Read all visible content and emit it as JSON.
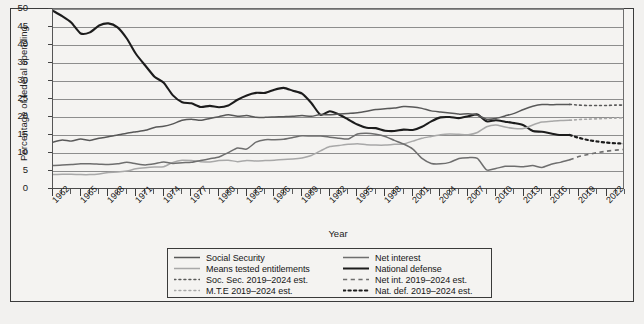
{
  "chart_data": {
    "type": "line",
    "title": "",
    "xlabel": "Year",
    "ylabel": "Percentage of federal spending",
    "xlim": [
      1962,
      2024
    ],
    "ylim": [
      0,
      50
    ],
    "yticks": [
      0,
      5,
      10,
      15,
      20,
      25,
      30,
      35,
      40,
      45,
      50
    ],
    "xticks": [
      1962,
      1965,
      1968,
      1971,
      1974,
      1977,
      1980,
      1983,
      1986,
      1989,
      1992,
      1995,
      1998,
      2001,
      2004,
      2007,
      2010,
      2013,
      2016,
      2019,
      2022
    ],
    "grid": true,
    "legend_position": "bottom-center",
    "x": [
      1962,
      1963,
      1964,
      1965,
      1966,
      1967,
      1968,
      1969,
      1970,
      1971,
      1972,
      1973,
      1974,
      1975,
      1976,
      1977,
      1978,
      1979,
      1980,
      1981,
      1982,
      1983,
      1984,
      1985,
      1986,
      1987,
      1988,
      1989,
      1990,
      1991,
      1992,
      1993,
      1994,
      1995,
      1996,
      1997,
      1998,
      1999,
      2000,
      2001,
      2002,
      2003,
      2004,
      2005,
      2006,
      2007,
      2008,
      2009,
      2010,
      2011,
      2012,
      2013,
      2014,
      2015,
      2016,
      2017,
      2018
    ],
    "series": [
      {
        "name": "National defense",
        "color": "#1c1c1c",
        "width": 2.1,
        "style": "solid",
        "values": [
          49.5,
          48.0,
          46.2,
          43.2,
          43.5,
          45.4,
          46.0,
          44.9,
          41.8,
          37.5,
          34.3,
          31.2,
          29.5,
          26.0,
          24.1,
          23.8,
          22.8,
          23.1,
          22.7,
          23.2,
          24.8,
          26.0,
          26.7,
          26.7,
          27.6,
          28.1,
          27.3,
          26.5,
          23.9,
          20.6,
          21.6,
          20.7,
          19.3,
          17.9,
          17.0,
          16.9,
          16.2,
          16.1,
          16.5,
          16.4,
          17.3,
          18.8,
          19.9,
          20.0,
          19.7,
          20.2,
          20.7,
          18.8,
          19.1,
          18.7,
          18.3,
          17.7,
          16.1,
          15.9,
          15.4,
          15.0,
          15.0
        ]
      },
      {
        "name": "Social Security",
        "color": "#585858",
        "width": 1.5,
        "style": "solid",
        "values": [
          13.0,
          13.6,
          13.3,
          13.9,
          13.5,
          14.1,
          14.5,
          15.0,
          15.5,
          15.9,
          16.3,
          17.1,
          17.4,
          18.1,
          19.1,
          19.4,
          19.1,
          19.6,
          20.1,
          20.6,
          20.2,
          20.4,
          19.9,
          19.9,
          20.0,
          20.1,
          20.2,
          20.4,
          20.2,
          20.7,
          20.6,
          20.8,
          21.0,
          21.2,
          21.6,
          22.1,
          22.3,
          22.5,
          22.9,
          22.8,
          22.4,
          21.7,
          21.4,
          21.1,
          20.8,
          20.9,
          20.5,
          19.4,
          19.6,
          20.3,
          21.0,
          22.1,
          23.0,
          23.5,
          23.4,
          23.5,
          23.5
        ]
      },
      {
        "name": "Means tested entitlements",
        "color": "#a8a8a8",
        "width": 1.5,
        "style": "solid",
        "values": [
          4.0,
          4.1,
          4.1,
          4.0,
          4.0,
          4.2,
          4.6,
          4.7,
          5.0,
          5.6,
          5.9,
          6.1,
          6.2,
          7.4,
          8.0,
          7.9,
          7.6,
          7.5,
          7.9,
          8.0,
          7.6,
          7.9,
          7.8,
          7.9,
          8.0,
          8.2,
          8.3,
          8.6,
          9.3,
          10.6,
          11.8,
          12.1,
          12.4,
          12.6,
          12.3,
          12.2,
          12.2,
          12.4,
          12.5,
          13.3,
          14.1,
          14.6,
          15.1,
          15.3,
          15.2,
          15.1,
          15.7,
          17.3,
          17.8,
          17.2,
          16.8,
          16.8,
          17.8,
          18.6,
          18.8,
          19.0,
          19.1
        ]
      },
      {
        "name": "Net interest",
        "color": "#6e6e6e",
        "width": 1.5,
        "style": "solid",
        "values": [
          6.5,
          6.7,
          6.8,
          7.0,
          7.0,
          6.9,
          6.8,
          7.0,
          7.4,
          7.0,
          6.7,
          7.0,
          7.5,
          7.1,
          7.3,
          7.4,
          7.9,
          8.4,
          8.9,
          10.1,
          11.4,
          11.1,
          13.0,
          13.7,
          13.7,
          13.8,
          14.3,
          14.8,
          14.7,
          14.7,
          14.4,
          14.1,
          13.9,
          15.3,
          15.5,
          15.2,
          14.6,
          13.5,
          12.5,
          11.1,
          8.5,
          7.1,
          7.0,
          7.4,
          8.5,
          8.7,
          8.5,
          5.3,
          5.7,
          6.3,
          6.3,
          6.2,
          6.5,
          6.0,
          6.9,
          7.4,
          8.1
        ]
      }
    ],
    "estimate_series": [
      {
        "name": "Soc. Sec. 2019–2024 est.",
        "color": "#585858",
        "style": "dotted",
        "x": [
          2018,
          2019,
          2020,
          2021,
          2022,
          2023,
          2024
        ],
        "values": [
          23.5,
          23.3,
          23.2,
          23.2,
          23.2,
          23.3,
          23.3
        ]
      },
      {
        "name": "M.T.E 2019–2024 est.",
        "color": "#a8a8a8",
        "style": "dotted",
        "x": [
          2018,
          2019,
          2020,
          2021,
          2022,
          2023,
          2024
        ],
        "values": [
          19.1,
          19.3,
          19.4,
          19.5,
          19.6,
          19.7,
          19.8
        ]
      },
      {
        "name": "Net int. 2019–2024 est.",
        "color": "#6e6e6e",
        "style": "dashed",
        "x": [
          2018,
          2019,
          2020,
          2021,
          2022,
          2023,
          2024
        ],
        "values": [
          8.1,
          9.0,
          9.6,
          10.1,
          10.5,
          10.8,
          11.0
        ]
      },
      {
        "name": "Nat. def. 2019–2024 est.",
        "color": "#1c1c1c",
        "style": "dotted-thick",
        "x": [
          2018,
          2019,
          2020,
          2021,
          2022,
          2023,
          2024
        ],
        "values": [
          15.0,
          14.2,
          13.6,
          13.2,
          12.9,
          12.7,
          12.6
        ]
      }
    ]
  },
  "axes": {
    "ylabel": "Percentage of federal spending",
    "xlabel": "Year",
    "ytick_labels": [
      "50",
      "45",
      "40",
      "35",
      "30",
      "25",
      "20",
      "15",
      "10",
      "5",
      "0"
    ],
    "xtick_labels": [
      "1962",
      "1965",
      "1968",
      "1971",
      "1974",
      "1977",
      "1980",
      "1983",
      "1986",
      "1989",
      "1992",
      "1995",
      "1998",
      "2001",
      "2004",
      "2007",
      "2010",
      "2013",
      "2016",
      "2019",
      "2022"
    ]
  },
  "legend": {
    "left_column": [
      {
        "label": "Social Security",
        "style": "solid",
        "color": "#585858",
        "width": 1.6
      },
      {
        "label": "Means tested entitlements",
        "style": "solid",
        "color": "#a8a8a8",
        "width": 1.6
      },
      {
        "label": "Soc. Sec. 2019–2024 est.",
        "style": "dotted",
        "color": "#585858",
        "width": 1.6
      },
      {
        "label": "M.T.E 2019–2024 est.",
        "style": "dotted",
        "color": "#a8a8a8",
        "width": 1.6
      }
    ],
    "right_column": [
      {
        "label": "Net interest",
        "style": "solid",
        "color": "#6e6e6e",
        "width": 1.6
      },
      {
        "label": "National defense",
        "style": "solid",
        "color": "#1c1c1c",
        "width": 2.2
      },
      {
        "label": "Net int. 2019–2024 est.",
        "style": "dashed",
        "color": "#6e6e6e",
        "width": 1.6
      },
      {
        "label": "Nat. def. 2019–2024 est.",
        "style": "dotted-thick",
        "color": "#1c1c1c",
        "width": 2.2
      }
    ]
  },
  "colors": {
    "background": "#f4f3f1",
    "gridline": "#8d8d8d",
    "axis": "#4a4a4a",
    "border": "#3b3b3b"
  }
}
